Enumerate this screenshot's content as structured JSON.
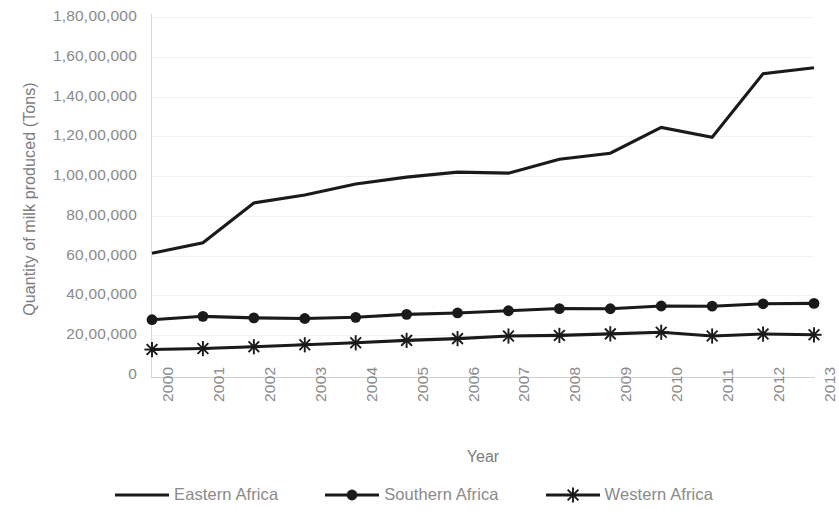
{
  "chart_data": {
    "type": "line",
    "title": "",
    "xlabel": "Year",
    "ylabel": "Quantity of milk produced (Tons)",
    "categories": [
      "2000",
      "2001",
      "2002",
      "2003",
      "2004",
      "2005",
      "2006",
      "2007",
      "2008",
      "2009",
      "2010",
      "2011",
      "2012",
      "2013"
    ],
    "ylim": [
      0,
      18000000
    ],
    "y_tick_values": [
      0,
      2000000,
      4000000,
      6000000,
      8000000,
      10000000,
      12000000,
      14000000,
      16000000,
      18000000
    ],
    "y_tick_labels": [
      "0",
      "20,00,000",
      "40,00,000",
      "60,00,000",
      "80,00,000",
      "1,00,00,000",
      "1,20,00,000",
      "1,40,00,000",
      "1,60,00,000",
      "1,80,00,000"
    ],
    "grid": true,
    "legend_position": "bottom",
    "series": [
      {
        "name": "Eastern Africa",
        "marker": "none",
        "color": "#1a1a1a",
        "values": [
          6120000,
          6650000,
          8650000,
          9050000,
          9600000,
          9950000,
          10200000,
          10150000,
          10850000,
          11150000,
          12450000,
          11950000,
          15150000,
          15450000
        ]
      },
      {
        "name": "Southern Africa",
        "marker": "circle",
        "color": "#1a1a1a",
        "values": [
          2780000,
          2950000,
          2870000,
          2840000,
          2900000,
          3050000,
          3120000,
          3230000,
          3340000,
          3330000,
          3470000,
          3460000,
          3580000,
          3600000
        ]
      },
      {
        "name": "Western Africa",
        "marker": "asterisk",
        "color": "#1a1a1a",
        "values": [
          1280000,
          1330000,
          1420000,
          1520000,
          1620000,
          1740000,
          1830000,
          1960000,
          1990000,
          2070000,
          2150000,
          1960000,
          2060000,
          2020000
        ]
      }
    ]
  },
  "axes": {
    "y_title": "Quantity of milk produced (Tons)",
    "x_title": "Year"
  },
  "legend": {
    "items": [
      {
        "label": "Eastern Africa",
        "marker": "line"
      },
      {
        "label": "Southern Africa",
        "marker": "line-circle"
      },
      {
        "label": "Western Africa",
        "marker": "line-asterisk"
      }
    ]
  }
}
